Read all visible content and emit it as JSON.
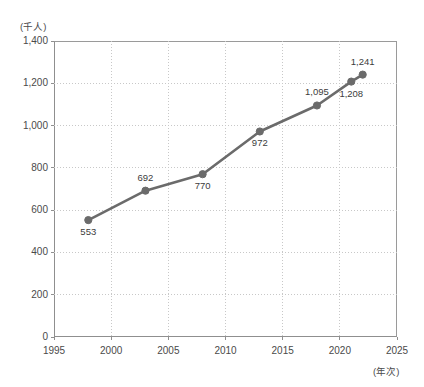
{
  "chart_data": {
    "type": "line",
    "title": "",
    "subtitle": "",
    "xlabel": "(年次)",
    "ylabel": "(千人)",
    "xlim": [
      1995,
      2025
    ],
    "ylim": [
      0,
      1400
    ],
    "grid": true,
    "legend": false,
    "legend_position": "none",
    "series_color": "#6b6b6b",
    "grid_color": "#c8c8c8",
    "axis_color": "#8f8f8f",
    "x": [
      1998,
      2003,
      2008,
      2013,
      2018,
      2021,
      2022
    ],
    "values": [
      553,
      692,
      770,
      972,
      1095,
      1208,
      1241
    ],
    "point_labels": [
      "553",
      "692",
      "770",
      "972",
      "1,095",
      "1,208",
      "1,241"
    ],
    "label_positions": [
      "below",
      "above",
      "below",
      "below",
      "above",
      "below",
      "above"
    ],
    "xticks": [
      1995,
      2000,
      2005,
      2010,
      2015,
      2020,
      2025
    ],
    "xtick_labels": [
      "1995",
      "2000",
      "2005",
      "2010",
      "2015",
      "2020",
      "2025"
    ],
    "yticks": [
      0,
      200,
      400,
      600,
      800,
      1000,
      1200,
      1400
    ],
    "ytick_labels": [
      "0",
      "200",
      "400",
      "600",
      "800",
      "1,000",
      "1,200",
      "1,400"
    ]
  }
}
